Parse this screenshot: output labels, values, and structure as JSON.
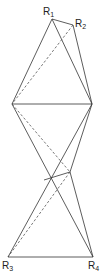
{
  "diagram": {
    "title": "",
    "stroke_color": "#333333",
    "background": "#ffffff",
    "labels": {
      "R1": {
        "main": "R",
        "sub": "1"
      },
      "R2": {
        "main": "R",
        "sub": "2"
      },
      "R3": {
        "main": "R",
        "sub": "3"
      },
      "R4": {
        "main": "R",
        "sub": "4"
      }
    },
    "nodes": {
      "R1": [
        52,
        19
      ],
      "R2": [
        73,
        25
      ],
      "L": [
        12,
        104
      ],
      "R": [
        92,
        104
      ],
      "P1": [
        44,
        180
      ],
      "P2": [
        70,
        172
      ],
      "R3": [
        8,
        257
      ],
      "R4": [
        93,
        257
      ]
    },
    "edges": [
      {
        "from": "R1",
        "to": "R2",
        "style": "solid"
      },
      {
        "from": "R1",
        "to": "L",
        "style": "solid"
      },
      {
        "from": "R1",
        "to": "R",
        "style": "solid"
      },
      {
        "from": "R2",
        "to": "R",
        "style": "solid"
      },
      {
        "from": "R2",
        "to": "L",
        "style": "dashed"
      },
      {
        "from": "L",
        "to": "R",
        "style": "solid"
      },
      {
        "from": "L",
        "to": "R4",
        "style": "solid"
      },
      {
        "from": "L",
        "to": "P2",
        "style": "dashed"
      },
      {
        "from": "R",
        "to": "R3",
        "style": "solid"
      },
      {
        "from": "R",
        "to": "P2",
        "style": "solid"
      },
      {
        "from": "P1",
        "to": "P2",
        "style": "solid"
      },
      {
        "from": "P2",
        "to": "R4",
        "style": "solid"
      },
      {
        "from": "P2",
        "to": "R3",
        "style": "dashed"
      },
      {
        "from": "R3",
        "to": "R4",
        "style": "solid"
      }
    ]
  }
}
